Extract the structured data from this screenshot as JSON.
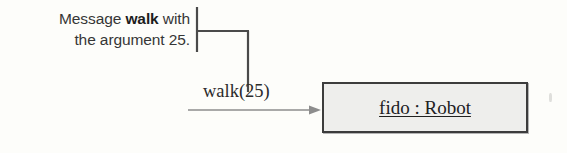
{
  "diagram": {
    "annotation": {
      "line1_prefix": "Message ",
      "line1_emphasis": "walk",
      "line1_suffix": " with",
      "line2": "the argument 25."
    },
    "message_label": "walk(25)",
    "object_box": {
      "label": "fido : Robot",
      "instance_name": "fido",
      "separator": " : ",
      "class_name": "Robot",
      "fill_color": "#eeeeec",
      "border_color": "#3c3c3c"
    },
    "arrow": {
      "direction": "right",
      "color": "#8d8d8d"
    },
    "leader": {
      "color": "#4a4a4a"
    },
    "background_color": "#fdfdfa",
    "text_color": "#363636"
  }
}
